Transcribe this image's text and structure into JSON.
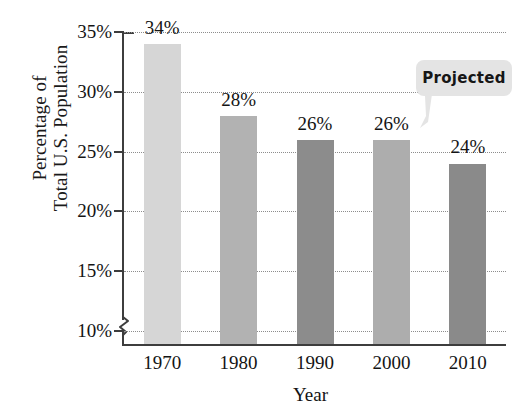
{
  "chart_data": {
    "type": "bar",
    "title": "",
    "xlabel": "Year",
    "ylabel": "Percentage of Total U.S. Population",
    "ylabel_lines": [
      "Percentage of",
      "Total U.S. Population"
    ],
    "categories": [
      "1970",
      "1980",
      "1990",
      "2000",
      "2010"
    ],
    "values": [
      34,
      28,
      26,
      26,
      24
    ],
    "value_labels": [
      "34%",
      "28%",
      "26%",
      "26%",
      "24%"
    ],
    "ylim": [
      10,
      35
    ],
    "yticks": [
      10,
      15,
      20,
      25,
      30,
      35
    ],
    "ytick_labels": [
      "10%",
      "15%",
      "20%",
      "25%",
      "30%",
      "35%"
    ],
    "grid": true,
    "axis_break": true,
    "legend": "none",
    "bar_colors": [
      "#d6d6d6",
      "#b2b2b2",
      "#8c8c8c",
      "#adadad",
      "#8a8a8a"
    ],
    "annotations": [
      {
        "text": "Projected",
        "target_category": "2010",
        "style": "speech-bubble",
        "fill": "#e4e4e4"
      }
    ]
  },
  "axis": {
    "line_color": "#3d3d3d",
    "grid_color": "#8d8d8d"
  }
}
